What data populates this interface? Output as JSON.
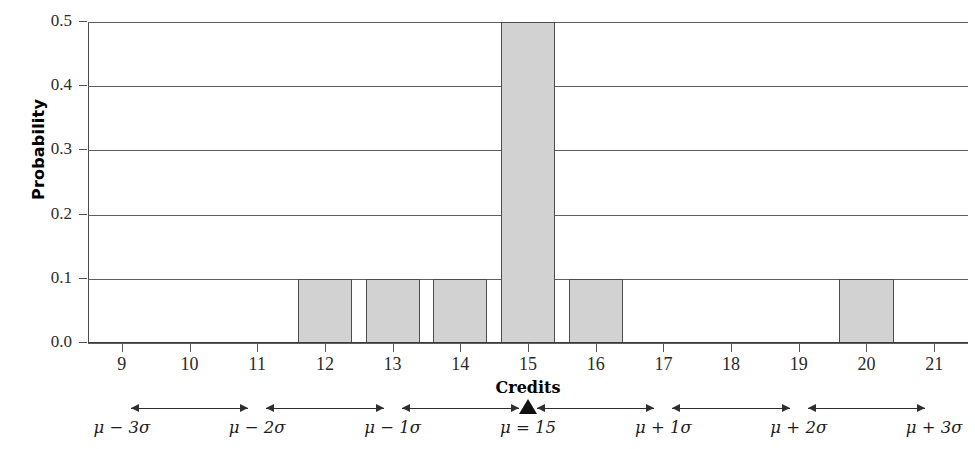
{
  "chart_data": {
    "type": "bar",
    "title": "",
    "xlabel": "Credits",
    "ylabel": "Probability",
    "categories": [
      9,
      10,
      11,
      12,
      13,
      14,
      15,
      16,
      17,
      18,
      19,
      20,
      21
    ],
    "values": [
      0.0,
      0.0,
      0.0,
      0.1,
      0.1,
      0.1,
      0.5,
      0.1,
      0.0,
      0.0,
      0.0,
      0.1,
      0.0
    ],
    "xlim": [
      8.5,
      21.5
    ],
    "ylim": [
      0.0,
      0.5
    ],
    "x_tick_labels": [
      "9",
      "10",
      "11",
      "12",
      "13",
      "14",
      "15",
      "16",
      "17",
      "18",
      "19",
      "20",
      "21"
    ],
    "y_ticks": [
      0.0,
      0.1,
      0.2,
      0.3,
      0.4,
      0.5
    ],
    "y_tick_labels": [
      "0.0",
      "0.1",
      "0.2",
      "0.3",
      "0.4",
      "0.5"
    ],
    "grid": "horizontal",
    "legend": "none",
    "bar_fill_color": "#d2d2d2",
    "bar_edge_color": "#4d4d4d",
    "annotations": {
      "mean_marker_value": 15,
      "mean_marker_label": "μ = 15",
      "sigma_axis_labels": [
        {
          "label": "μ − 3σ",
          "value": 9
        },
        {
          "label": "μ − 2σ",
          "value": 11
        },
        {
          "label": "μ − 1σ",
          "value": 13
        },
        {
          "label": "μ = 15",
          "value": 15
        },
        {
          "label": "μ + 1σ",
          "value": 17
        },
        {
          "label": "μ + 2σ",
          "value": 19
        },
        {
          "label": "μ + 3σ",
          "value": 21
        }
      ]
    }
  },
  "axes": {
    "y_title": "Probability",
    "x_title": "Credits"
  }
}
